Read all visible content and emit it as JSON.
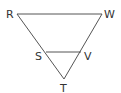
{
  "diagram": {
    "type": "geometry-triangles",
    "line_color": "#555555",
    "label_color": "#333333",
    "points": {
      "R": {
        "label": "R",
        "x": 17,
        "y": 14
      },
      "W": {
        "label": "W",
        "x": 102,
        "y": 14
      },
      "S": {
        "label": "S",
        "x": 46,
        "y": 52
      },
      "V": {
        "label": "V",
        "x": 81,
        "y": 52
      },
      "T": {
        "label": "T",
        "x": 64,
        "y": 79
      }
    },
    "segments": [
      "RW",
      "RT",
      "WT",
      "SV"
    ]
  }
}
